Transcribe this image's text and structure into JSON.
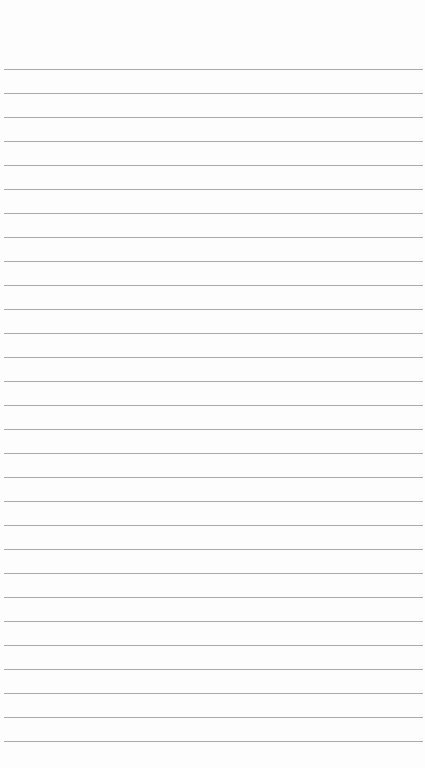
{
  "paper": {
    "type": "lined-paper",
    "background": "#fdfdfd",
    "line_color": "#a9a9a9",
    "first_line_y": 69,
    "line_spacing": 24,
    "line_count": 29
  }
}
